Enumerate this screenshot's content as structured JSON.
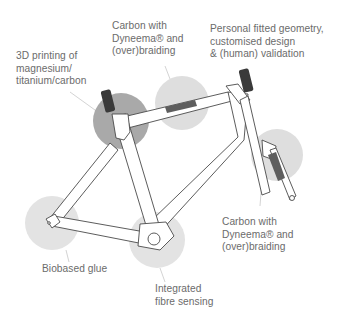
{
  "diagram": {
    "colors": {
      "background": "#ffffff",
      "highlight_circle_light": "#dedede",
      "highlight_circle_dark": "#a9a9a9",
      "frame_stroke": "#4a4a4a",
      "frame_fill": "#ffffff",
      "grip_fill": "#3a3a3a",
      "label_text": "#6b6b6b",
      "leader_line": "#c8c8c8"
    },
    "callouts": [
      {
        "id": "3d-printing",
        "lines": [
          "3D printing of",
          "magnesium/",
          "titanium/carbon"
        ],
        "target": "head-tube-junction"
      },
      {
        "id": "carbon-dyneema-top",
        "lines": [
          "Carbon with",
          "Dyneema® and",
          "(over)braiding"
        ],
        "target": "top-tube"
      },
      {
        "id": "personal-geometry",
        "lines": [
          "Personal fitted geometry,",
          "customised design",
          "& (human) validation"
        ],
        "target": "whole-frame"
      },
      {
        "id": "carbon-dyneema-fork",
        "lines": [
          "Carbon with",
          "Dyneema® and",
          "(over)braiding"
        ],
        "target": "fork"
      },
      {
        "id": "biobased-glue",
        "lines": [
          "Biobased glue"
        ],
        "target": "rear-dropout"
      },
      {
        "id": "fibre-sensing",
        "lines": [
          "Integrated",
          "fibre sensing"
        ],
        "target": "bottom-bracket"
      }
    ]
  }
}
